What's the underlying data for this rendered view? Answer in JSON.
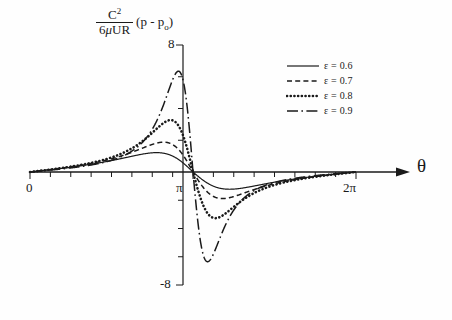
{
  "figure": {
    "background": "#fefefe",
    "ink_color": "#1a1a1a"
  },
  "axes": {
    "ylabel_numerator": "C",
    "ylabel_numerator_sup": "2",
    "ylabel_denominator_pre": "6",
    "ylabel_denominator_mu": "μ",
    "ylabel_denominator_post": "UR",
    "ylabel_term": "(p - p",
    "ylabel_term_sub": "o",
    "ylabel_term_end": ")",
    "y_top_tick": "8",
    "y_bottom_tick": "-8",
    "x_tick_0": "0",
    "x_tick_pi": "π",
    "x_tick_2pi": "2π",
    "x_axis_symbol": "θ"
  },
  "legend": {
    "entries": [
      {
        "label": "ε = 0.6",
        "style": "solid",
        "color": "#1a1a1a"
      },
      {
        "label": "ε = 0.7",
        "style": "dashed",
        "color": "#1a1a1a"
      },
      {
        "label": "ε = 0.8",
        "style": "dash-dot-dot",
        "color": "#1a1a1a"
      },
      {
        "label": "ε = 0.9",
        "style": "long-dash-dot",
        "color": "#1a1a1a"
      }
    ]
  },
  "chart_data": {
    "type": "line",
    "title": "",
    "xlabel": "θ",
    "ylabel": "C^2/(6μUR) (p - p_o)",
    "xlim": [
      0,
      6.283185307179586
    ],
    "ylim": [
      -8,
      8
    ],
    "xticks": [
      0,
      3.141592653589793,
      6.283185307179586
    ],
    "xticklabels": [
      "0",
      "π",
      "2π"
    ],
    "yticks": [
      8,
      -8
    ],
    "yticklabels": [
      "8",
      "-8"
    ],
    "grid": false,
    "legend_position": "upper-right",
    "formula": "eps*sin(t)*(2+eps*cos(t)) / ((2+eps^2)*(1+eps*cos(t))^2)",
    "series": [
      {
        "name": "ε = 0.6",
        "epsilon": 0.6,
        "style": "solid",
        "color": "#1a1a1a",
        "peak_value": 1.22,
        "peak_theta": 2.19,
        "trough_value": -1.22,
        "trough_theta": 4.09
      },
      {
        "name": "ε = 0.7",
        "epsilon": 0.7,
        "style": "dashed",
        "color": "#1a1a1a",
        "peak_value": 1.88,
        "peak_theta": 2.33,
        "trough_value": -1.88,
        "trough_theta": 3.95
      },
      {
        "name": "ε = 0.8",
        "epsilon": 0.8,
        "style": "dash-dot-dot",
        "color": "#1a1a1a",
        "peak_value": 3.27,
        "peak_theta": 2.48,
        "trough_value": -3.27,
        "trough_theta": 3.8
      },
      {
        "name": "ε = 0.9",
        "epsilon": 0.9,
        "style": "long-dash-dot",
        "color": "#1a1a1a",
        "peak_value": 6.35,
        "peak_theta": 2.65,
        "trough_value": -6.35,
        "trough_theta": 3.63
      }
    ]
  },
  "geometry": {
    "x_left_px": 30,
    "x_right_px": 356,
    "x_axis_y_px": 172,
    "y_axis_x_px": 183,
    "y_top_px": 45,
    "y_bottom_px": 285,
    "arrow_tip_px": 410
  }
}
